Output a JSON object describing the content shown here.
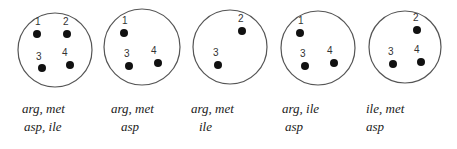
{
  "diagram": {
    "panels": [
      {
        "circle": {
          "cx": 55,
          "cy": 50,
          "r": 37
        },
        "dots": [
          {
            "id": "1",
            "x": 37,
            "y": 34,
            "lx": 35,
            "ly": 25
          },
          {
            "id": "2",
            "x": 67,
            "y": 34,
            "lx": 63,
            "ly": 25
          },
          {
            "id": "3",
            "x": 42,
            "y": 68,
            "lx": 36,
            "ly": 60
          },
          {
            "id": "4",
            "x": 70,
            "y": 65,
            "lx": 62,
            "ly": 56
          }
        ],
        "line1": "arg, met",
        "line2": "asp, ile",
        "label_x": 22
      },
      {
        "circle": {
          "cx": 142,
          "cy": 47,
          "r": 38
        },
        "dots": [
          {
            "id": "1",
            "x": 124,
            "y": 33,
            "lx": 122,
            "ly": 24
          },
          {
            "id": "3",
            "x": 129,
            "y": 66,
            "lx": 124,
            "ly": 57
          },
          {
            "id": "4",
            "x": 158,
            "y": 63,
            "lx": 151,
            "ly": 54
          }
        ],
        "line1": "arg, met",
        "line2": "asp",
        "label_x": 112
      },
      {
        "circle": {
          "cx": 230,
          "cy": 47,
          "r": 37
        },
        "dots": [
          {
            "id": "2",
            "x": 242,
            "y": 31,
            "lx": 238,
            "ly": 22
          },
          {
            "id": "3",
            "x": 218,
            "y": 65,
            "lx": 213,
            "ly": 56
          }
        ],
        "line1": "arg, met",
        "line2": "ile",
        "label_x": 192
      },
      {
        "circle": {
          "cx": 318,
          "cy": 48,
          "r": 37
        },
        "dots": [
          {
            "id": "1",
            "x": 300,
            "y": 33,
            "lx": 298,
            "ly": 24
          },
          {
            "id": "3",
            "x": 305,
            "y": 66,
            "lx": 300,
            "ly": 57
          },
          {
            "id": "4",
            "x": 334,
            "y": 63,
            "lx": 327,
            "ly": 54
          }
        ],
        "line1": "arg, ile",
        "line2": "asp",
        "label_x": 282
      },
      {
        "circle": {
          "cx": 405,
          "cy": 47,
          "r": 36
        },
        "dots": [
          {
            "id": "2",
            "x": 417,
            "y": 30,
            "lx": 413,
            "ly": 21
          },
          {
            "id": "3",
            "x": 393,
            "y": 64,
            "lx": 388,
            "ly": 55
          },
          {
            "id": "4",
            "x": 421,
            "y": 62,
            "lx": 414,
            "ly": 53
          }
        ],
        "line1": "ile, met",
        "line2": "asp",
        "label_x": 366
      }
    ]
  },
  "labels": [
    {
      "line1": "arg, met",
      "line2": "asp, ile"
    },
    {
      "line1": "arg, met",
      "line2": "asp"
    },
    {
      "line1": "arg, met",
      "line2": "ile"
    },
    {
      "line1": "arg, ile",
      "line2": "asp"
    },
    {
      "line1": "ile, met",
      "line2": "asp"
    }
  ]
}
